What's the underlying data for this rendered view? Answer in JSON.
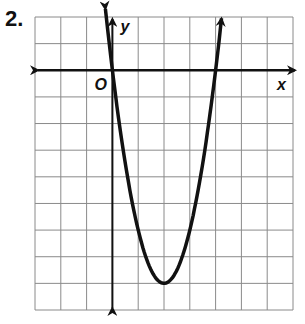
{
  "problem": {
    "number": "2."
  },
  "graph": {
    "x_label": "x",
    "y_label": "y",
    "origin_label": "O",
    "grid": {
      "cols": 10,
      "rows": 11,
      "left": 35,
      "top": 17,
      "right": 293,
      "bottom": 310,
      "y_axis_col": 3,
      "x_axis_row": 2
    },
    "colors": {
      "grid": "#8a8a8a",
      "axis": "#111111",
      "curve": "#111111"
    }
  },
  "chart_data": {
    "type": "line",
    "title": "",
    "xlabel": "x",
    "ylabel": "y",
    "equation": "y = 2x(x - 4)",
    "roots": [
      0,
      4
    ],
    "vertex": [
      2,
      -8
    ],
    "xlim": [
      -3,
      7
    ],
    "ylim": [
      -9,
      2
    ],
    "grid": true,
    "x": [
      -0.4,
      0,
      0.5,
      1,
      1.5,
      2,
      2.5,
      3,
      3.5,
      4,
      4.4
    ],
    "y": [
      3.52,
      0,
      -3.5,
      -6,
      -7.5,
      -8,
      -7.5,
      -6,
      -3.5,
      0,
      3.52
    ]
  }
}
